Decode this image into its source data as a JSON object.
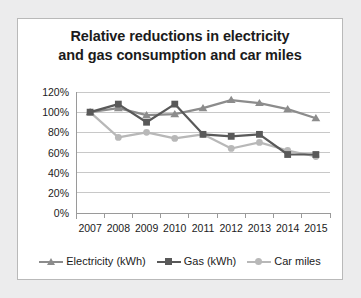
{
  "chart_data": {
    "type": "line",
    "title": "Relative reductions in electricity and gas consumption and car miles",
    "title_line1": "Relative reductions in electricity",
    "title_line2": "and gas consumption and car miles",
    "xlabel": "",
    "ylabel": "",
    "categories": [
      "2007",
      "2008",
      "2009",
      "2010",
      "2011",
      "2012",
      "2013",
      "2014",
      "2015"
    ],
    "ylim": [
      0,
      120
    ],
    "ytick_labels": [
      "120%",
      "100%",
      "80%",
      "60%",
      "40%",
      "20%",
      "0%"
    ],
    "ytick_values": [
      120,
      100,
      80,
      60,
      40,
      20,
      0
    ],
    "grid": true,
    "legend_position": "bottom",
    "series": [
      {
        "name": "Electricity (kWh)",
        "marker": "triangle",
        "color": "#8c8c8c",
        "values": [
          100,
          104,
          97,
          98,
          104,
          112,
          109,
          103,
          94
        ]
      },
      {
        "name": "Gas (kWh)",
        "marker": "square",
        "color": "#595959",
        "values": [
          100,
          108,
          90,
          108,
          78,
          76,
          78,
          58,
          58
        ]
      },
      {
        "name": "Car miles",
        "marker": "circle",
        "color": "#b8b8b8",
        "values": [
          100,
          75,
          80,
          74,
          78,
          64,
          70,
          62,
          56
        ]
      }
    ]
  },
  "colors": {
    "panel_background": "#ffffff",
    "page_background": "#ececed",
    "panel_border": "#b9b9b9",
    "grid": "#c8c8c8",
    "axis": "#9a9a9a",
    "text": "#1b1b1b"
  }
}
